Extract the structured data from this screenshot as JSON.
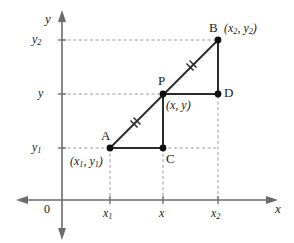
{
  "figure": {
    "type": "coordinate-geometry-diagram",
    "colors": {
      "background": "#ffffff",
      "axis": "#6b6b6b",
      "dashed_guide": "#9a9a9a",
      "segment": "#2b2b2b",
      "point": "#111111",
      "text": "#1a1a1a"
    },
    "axes": {
      "x_axis_label": "x",
      "y_axis_label": "y",
      "origin_label": "0",
      "x_ticks": [
        "x1",
        "x",
        "x2"
      ],
      "y_ticks": [
        "y2",
        "y",
        "y1"
      ]
    },
    "tick_labels": {
      "x1": {
        "base": "x",
        "sub": "1"
      },
      "x": {
        "base": "x",
        "sub": ""
      },
      "x2": {
        "base": "x",
        "sub": "2"
      },
      "y1": {
        "base": "y",
        "sub": "1"
      },
      "y": {
        "base": "y",
        "sub": ""
      },
      "y2": {
        "base": "y",
        "sub": "2"
      }
    },
    "points": [
      {
        "id": "A",
        "label": "A",
        "coord_label": "(x1, y1)",
        "x": 110,
        "y": 148
      },
      {
        "id": "B",
        "label": "B",
        "coord_label": "(x2, y2)",
        "x": 218,
        "y": 40
      },
      {
        "id": "P",
        "label": "P",
        "coord_label": "(x, y)",
        "x": 163,
        "y": 94
      },
      {
        "id": "C",
        "label": "C",
        "coord_label": "",
        "x": 163,
        "y": 148
      },
      {
        "id": "D",
        "label": "D",
        "coord_label": "",
        "x": 218,
        "y": 94
      }
    ],
    "segments": [
      {
        "id": "AP",
        "from": "A",
        "to": "P",
        "style": "solid",
        "tick_marks": 2
      },
      {
        "id": "PB",
        "from": "P",
        "to": "B",
        "style": "solid",
        "tick_marks": 2
      },
      {
        "id": "AC",
        "from": "A",
        "to": "C",
        "style": "solid",
        "tick_marks": 0
      },
      {
        "id": "PC",
        "from": "P",
        "to": "C",
        "style": "solid",
        "tick_marks": 0
      },
      {
        "id": "PD",
        "from": "P",
        "to": "D",
        "style": "solid",
        "tick_marks": 0
      },
      {
        "id": "BD",
        "from": "B",
        "to": "D",
        "style": "solid",
        "tick_marks": 0
      }
    ],
    "guides": [
      {
        "id": "guide-y2",
        "orientation": "horizontal"
      },
      {
        "id": "guide-y",
        "orientation": "horizontal"
      },
      {
        "id": "guide-y1",
        "orientation": "horizontal"
      },
      {
        "id": "guide-x1",
        "orientation": "vertical"
      },
      {
        "id": "guide-x",
        "orientation": "vertical"
      },
      {
        "id": "guide-x2",
        "orientation": "vertical"
      }
    ]
  },
  "labels": {
    "A": "A",
    "B": "B",
    "C": "C",
    "D": "D",
    "P": "P",
    "origin": "0",
    "axis_x": "x",
    "axis_y": "y",
    "coord_A_open": "(",
    "coord_A_mid": ", ",
    "coord_A_close": ")",
    "coord_P": "(x, y)"
  }
}
